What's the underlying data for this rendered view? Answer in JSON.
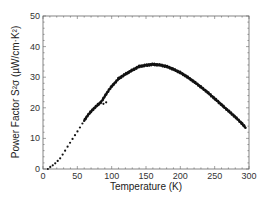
{
  "chart_data": {
    "type": "line",
    "title": "",
    "xlabel": "Temperature (K)",
    "ylabel": "Power Factor S²σ (µW/cm·K²)",
    "xlim": [
      0,
      300
    ],
    "ylim": [
      0,
      50
    ],
    "xticks": [
      0,
      50,
      100,
      150,
      200,
      250,
      300
    ],
    "yticks": [
      0,
      10,
      20,
      30,
      40,
      50
    ],
    "xtick_labels": [
      "0",
      "50",
      "100",
      "150",
      "200",
      "250",
      "300"
    ],
    "ytick_labels": [
      "0",
      "10",
      "20",
      "30",
      "40",
      "50"
    ],
    "grid": false,
    "legend": null,
    "series": [
      {
        "name": "Power Factor",
        "style": "dense black markers forming a thick curve; sparse dots below ~60 K",
        "color": "#111111",
        "x": [
          7,
          10,
          15,
          20,
          25,
          30,
          35,
          40,
          45,
          50,
          55,
          60,
          65,
          70,
          75,
          80,
          85,
          90,
          95,
          100,
          110,
          120,
          130,
          140,
          150,
          160,
          170,
          180,
          190,
          200,
          210,
          220,
          230,
          240,
          250,
          260,
          270,
          280,
          290,
          295
        ],
        "y": [
          0,
          0.6,
          1.3,
          2.3,
          3.5,
          5.2,
          7,
          8.8,
          10.5,
          12.2,
          14,
          15.8,
          17.5,
          18.8,
          20,
          21,
          22,
          23.8,
          25.5,
          27,
          29.5,
          31,
          32.3,
          33.5,
          33.9,
          34.2,
          34,
          33.5,
          32.6,
          31.5,
          30.1,
          28.5,
          26.8,
          25,
          23,
          21,
          19,
          17,
          14.8,
          13.5
        ]
      }
    ]
  }
}
